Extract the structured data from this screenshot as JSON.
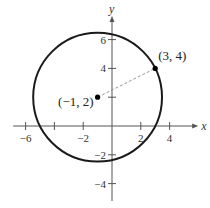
{
  "diagram": {
    "type": "circle-on-coordinate-plane",
    "axes": {
      "x_label": "x",
      "y_label": "y",
      "x_range": [
        -7,
        5.5
      ],
      "y_range": [
        -5,
        7.5
      ],
      "x_ticks": [
        -6,
        -4,
        -2,
        2,
        4
      ],
      "x_tick_labels": [
        {
          "value": -6,
          "text": "−6"
        },
        {
          "value": -2,
          "text": "−2"
        },
        {
          "value": 2,
          "text": "2"
        },
        {
          "value": 4,
          "text": "4"
        }
      ],
      "y_ticks": [
        -4,
        -2,
        2,
        4,
        6
      ],
      "y_tick_labels": [
        {
          "value": 6,
          "text": "6"
        },
        {
          "value": 4,
          "text": "4"
        },
        {
          "value": -2,
          "text": "−2"
        },
        {
          "value": -4,
          "text": "−4"
        }
      ]
    },
    "circle": {
      "center": [
        -1,
        2
      ],
      "radius_squared": 20
    },
    "points": [
      {
        "id": "center",
        "coords": [
          -1,
          2
        ],
        "label": "(−1, 2)"
      },
      {
        "id": "on-circle",
        "coords": [
          3,
          4
        ],
        "label": "(3, 4)"
      }
    ],
    "dashed_segment": {
      "from": [
        -1,
        2
      ],
      "to": [
        3,
        4
      ]
    },
    "colors": {
      "circle": "#1a1a1a",
      "axis": "#555555",
      "dashed": "#999999",
      "point": "#000000"
    }
  }
}
